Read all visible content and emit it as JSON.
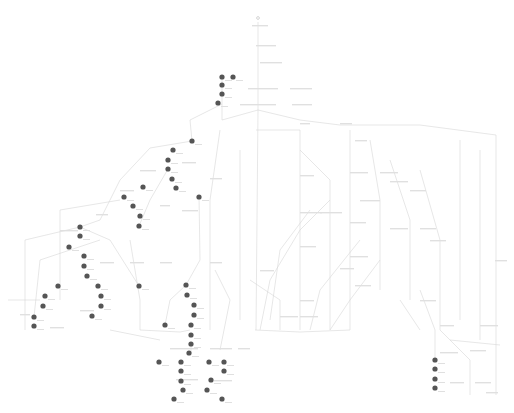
{
  "diagram": {
    "type": "state-flow-graph",
    "background": "#ffffff",
    "edge_color": "#d6d6d6",
    "node_color": "#555555",
    "label_color": "#e0e0e0",
    "labels_legible": false,
    "filled_nodes": [
      [
        222,
        77
      ],
      [
        233,
        77
      ],
      [
        222,
        85
      ],
      [
        222,
        94
      ],
      [
        218,
        103
      ],
      [
        192,
        141
      ],
      [
        173,
        150
      ],
      [
        168,
        160
      ],
      [
        168,
        169
      ],
      [
        172,
        179
      ],
      [
        176,
        188
      ],
      [
        143,
        187
      ],
      [
        199,
        197
      ],
      [
        124,
        197
      ],
      [
        133,
        206
      ],
      [
        140,
        216
      ],
      [
        139,
        226
      ],
      [
        80,
        227
      ],
      [
        80,
        236
      ],
      [
        69,
        247
      ],
      [
        84,
        256
      ],
      [
        84,
        266
      ],
      [
        87,
        276
      ],
      [
        58,
        286
      ],
      [
        98,
        286
      ],
      [
        139,
        286
      ],
      [
        45,
        296
      ],
      [
        43,
        306
      ],
      [
        34,
        317
      ],
      [
        34,
        326
      ],
      [
        101,
        296
      ],
      [
        101,
        306
      ],
      [
        92,
        316
      ],
      [
        186,
        285
      ],
      [
        187,
        295
      ],
      [
        194,
        305
      ],
      [
        194,
        315
      ],
      [
        165,
        325
      ],
      [
        191,
        325
      ],
      [
        191,
        335
      ],
      [
        191,
        344
      ],
      [
        189,
        353
      ],
      [
        159,
        362
      ],
      [
        181,
        362
      ],
      [
        209,
        362
      ],
      [
        224,
        362
      ],
      [
        181,
        371
      ],
      [
        224,
        371
      ],
      [
        181,
        381
      ],
      [
        211,
        380
      ],
      [
        183,
        390
      ],
      [
        207,
        390
      ],
      [
        174,
        399
      ],
      [
        222,
        399
      ],
      [
        435,
        360
      ],
      [
        435,
        369
      ],
      [
        435,
        379
      ],
      [
        435,
        388
      ]
    ],
    "label_boxes": [
      [
        252,
        25,
        16
      ],
      [
        256,
        45,
        20
      ],
      [
        260,
        62,
        22
      ],
      [
        248,
        88,
        30
      ],
      [
        290,
        88,
        22
      ],
      [
        240,
        104,
        36
      ],
      [
        292,
        104,
        20
      ],
      [
        300,
        123,
        10
      ],
      [
        340,
        123,
        12
      ],
      [
        355,
        140,
        12
      ],
      [
        350,
        172,
        18
      ],
      [
        380,
        172,
        18
      ],
      [
        390,
        181,
        18
      ],
      [
        360,
        200,
        20
      ],
      [
        410,
        190,
        16
      ],
      [
        300,
        175,
        14
      ],
      [
        300,
        212,
        22
      ],
      [
        320,
        212,
        22
      ],
      [
        350,
        222,
        16
      ],
      [
        390,
        228,
        18
      ],
      [
        420,
        228,
        16
      ],
      [
        300,
        246,
        16
      ],
      [
        350,
        256,
        18
      ],
      [
        430,
        240,
        16
      ],
      [
        495,
        260,
        12
      ],
      [
        140,
        170,
        16
      ],
      [
        182,
        162,
        14
      ],
      [
        210,
        178,
        12
      ],
      [
        160,
        205,
        10
      ],
      [
        120,
        190,
        14
      ],
      [
        182,
        210,
        16
      ],
      [
        96,
        214,
        12
      ],
      [
        60,
        230,
        18
      ],
      [
        100,
        262,
        14
      ],
      [
        130,
        262,
        14
      ],
      [
        160,
        262,
        12
      ],
      [
        210,
        262,
        12
      ],
      [
        260,
        270,
        14
      ],
      [
        300,
        300,
        14
      ],
      [
        340,
        268,
        14
      ],
      [
        355,
        285,
        16
      ],
      [
        280,
        316,
        18
      ],
      [
        300,
        316,
        18
      ],
      [
        420,
        300,
        16
      ],
      [
        440,
        325,
        14
      ],
      [
        480,
        325,
        18
      ],
      [
        470,
        350,
        16
      ],
      [
        440,
        352,
        18
      ],
      [
        450,
        382,
        14
      ],
      [
        475,
        382,
        16
      ],
      [
        486,
        392,
        12
      ],
      [
        170,
        348,
        28
      ],
      [
        210,
        348,
        22
      ],
      [
        238,
        348,
        12
      ],
      [
        176,
        379,
        22
      ],
      [
        214,
        380,
        18
      ],
      [
        20,
        314,
        10
      ],
      [
        50,
        327,
        14
      ],
      [
        80,
        310,
        14
      ]
    ],
    "edges": [
      "M258,22 L258,110",
      "M258,110 L222,120 L222,77",
      "M258,110 L300,120 L340,125 L420,125 L496,135 L496,395",
      "M222,104 L190,120 L192,141",
      "M192,141 L150,148 L120,180 L100,220 L80,227",
      "M80,227 L25,240 L25,330",
      "M80,227 L110,240 L139,286",
      "M168,169 L150,200 L139,226",
      "M199,197 L200,260 L186,285",
      "M186,285 L170,300 L165,325",
      "M191,344 L191,353",
      "M258,110 L256,330",
      "M256,130 L300,130 L300,330",
      "M300,150 L330,180 L330,330",
      "M350,130 L350,250 L350,330",
      "M370,140 L380,200 L380,290",
      "M390,160 L410,220 L410,300",
      "M420,170 L440,240 L440,330",
      "M460,140 L460,320",
      "M480,150 L480,340",
      "M420,290 L435,330 L435,360",
      "M440,330 L470,360 L470,395",
      "M240,150 L240,320",
      "M220,130 L210,200 L210,330",
      "M120,200 L60,210 L60,300",
      "M100,240 L40,260 L34,317",
      "M130,240 L140,300 L140,330",
      "M215,270 L230,300 L220,350",
      "M330,200 L300,230 L270,280 L260,330",
      "M310,210 L280,250 L270,320",
      "M360,240 L320,290 L310,330",
      "M380,260 L350,300 L330,330",
      "M250,280 L280,300 L280,330",
      "M255,330 L300,332 L350,330",
      "M140,330 L180,332 L190,330",
      "M8,300 L40,300",
      "M110,330 L160,340",
      "M400,300 L420,330",
      "M450,340 L500,345"
    ]
  }
}
